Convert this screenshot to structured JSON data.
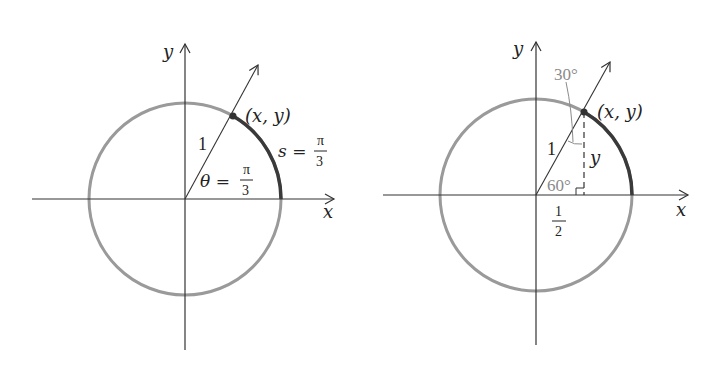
{
  "figures": [
    {
      "id": "left",
      "axes": {
        "x_label": "x",
        "y_label": "y"
      },
      "point_label": "(x, y)",
      "radius_label": "1",
      "angle_label": {
        "lhs": "θ =",
        "num": "π",
        "den": "3"
      },
      "arc_label": {
        "lhs": "s =",
        "num": "π",
        "den": "3"
      }
    },
    {
      "id": "right",
      "axes": {
        "x_label": "x",
        "y_label": "y"
      },
      "point_label": "(x, y)",
      "radius_label": "1",
      "height_label": "y",
      "angle_top": "30°",
      "angle_bottom": "60°",
      "base_label": {
        "num": "1",
        "den": "2"
      }
    }
  ],
  "colors": {
    "circle": "#9a9a9a",
    "arc": "#3a3a3a",
    "axis": "#333333",
    "gray_text": "#8a8a8a"
  }
}
